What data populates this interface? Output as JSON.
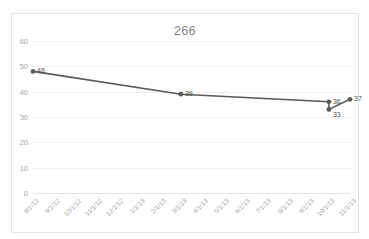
{
  "chart_data": {
    "type": "line",
    "title": "266",
    "xlabel": "",
    "ylabel": "",
    "grid": true,
    "legend": false,
    "ylim": [
      0,
      60
    ],
    "yticks": [
      0,
      10,
      20,
      30,
      40,
      50,
      60
    ],
    "categories": [
      "8/1/12",
      "9/1/12",
      "10/1/12",
      "11/1/12",
      "12/1/12",
      "1/1/13",
      "2/1/13",
      "3/1/13",
      "4/1/13",
      "5/1/13",
      "6/1/13",
      "7/1/13",
      "8/1/13",
      "9/1/13",
      "10/1/13",
      "11/1/13"
    ],
    "series": [
      {
        "name": "266",
        "points": [
          {
            "x": "8/1/12",
            "y": 48,
            "label": "48"
          },
          {
            "x": "3/1/13",
            "y": 39,
            "label": "39"
          },
          {
            "x": "10/1/13",
            "y": 36,
            "label": "36"
          },
          {
            "x": "10/1/13",
            "y": 33,
            "label": "33"
          },
          {
            "x": "11/1/13",
            "y": 37,
            "label": "37"
          }
        ]
      }
    ],
    "colors": {
      "line": "#595959",
      "marker": "#595959",
      "gridline": "#f0f0f0",
      "tick_text": "#a6a6a6",
      "title_text": "#7f7f7f",
      "data_label_text": "#4d4d4d",
      "border": "#e2e2e2"
    }
  }
}
